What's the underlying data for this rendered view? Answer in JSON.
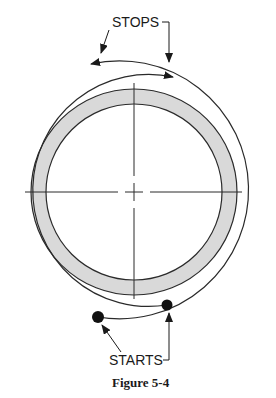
{
  "figure": {
    "caption": "Figure 5-4",
    "labels": {
      "stops": "STOPS",
      "starts": "STARTS"
    }
  },
  "colors": {
    "line": "#2a2a2a",
    "band_fill": "#d9d9d9",
    "background": "#ffffff"
  }
}
